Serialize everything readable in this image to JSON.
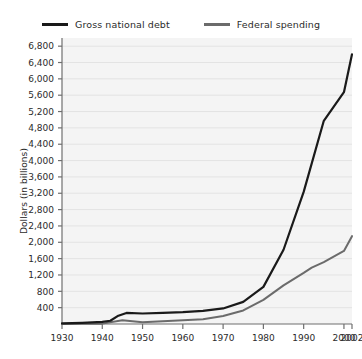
{
  "chart_data": {
    "type": "line",
    "title": "",
    "xlabel": "",
    "ylabel": "Dollars (in billions)",
    "xlim": [
      1930,
      2002
    ],
    "ylim": [
      0,
      7000
    ],
    "grid": true,
    "legend_position": "top-center",
    "y_ticks": [
      "400",
      "800",
      "1,200",
      "1,600",
      "2,000",
      "2,400",
      "2,800",
      "3,200",
      "3,600",
      "4,000",
      "4,400",
      "4,800",
      "5,200",
      "5,600",
      "6,000",
      "6,400",
      "6,800"
    ],
    "y_tick_values": [
      400,
      800,
      1200,
      1600,
      2000,
      2400,
      2800,
      3200,
      3600,
      4000,
      4400,
      4800,
      5200,
      5600,
      6000,
      6400,
      6800
    ],
    "x_ticks": [
      "1930",
      "1940",
      "1950",
      "1960",
      "1970",
      "1980",
      "1990",
      "2000",
      "2002"
    ],
    "x_tick_values": [
      1930,
      1940,
      1950,
      1960,
      1970,
      1980,
      1990,
      2000,
      2002
    ],
    "series": [
      {
        "name": "Gross national debt",
        "color": "#1a1a1a",
        "x": [
          1930,
          1935,
          1940,
          1942,
          1944,
          1946,
          1950,
          1955,
          1960,
          1965,
          1970,
          1975,
          1980,
          1985,
          1990,
          1995,
          2000,
          2002
        ],
        "values": [
          16,
          29,
          51,
          79,
          204,
          271,
          257,
          274,
          291,
          323,
          381,
          542,
          909,
          1817,
          3233,
          4974,
          5674,
          6600
        ]
      },
      {
        "name": "Federal spending",
        "color": "#6b6b6b",
        "x": [
          1930,
          1935,
          1940,
          1945,
          1950,
          1955,
          1960,
          1965,
          1970,
          1975,
          1980,
          1985,
          1990,
          1992,
          1995,
          2000,
          2002
        ],
        "values": [
          3,
          6,
          9,
          93,
          43,
          68,
          92,
          118,
          196,
          332,
          591,
          946,
          1253,
          1382,
          1516,
          1789,
          2150
        ]
      }
    ]
  },
  "legend": {
    "entries": [
      {
        "label": "Gross national debt",
        "color": "#1a1a1a"
      },
      {
        "label": "Federal spending",
        "color": "#6b6b6b"
      }
    ]
  },
  "axes": {
    "y_title": "Dollars (in billions)"
  },
  "colors": {
    "plot_background": "#f4f4f4",
    "gridline": "#e3e3e3",
    "axis": "#6f6f6f",
    "text": "#2b2b2b",
    "page_background": "#ffffff"
  }
}
